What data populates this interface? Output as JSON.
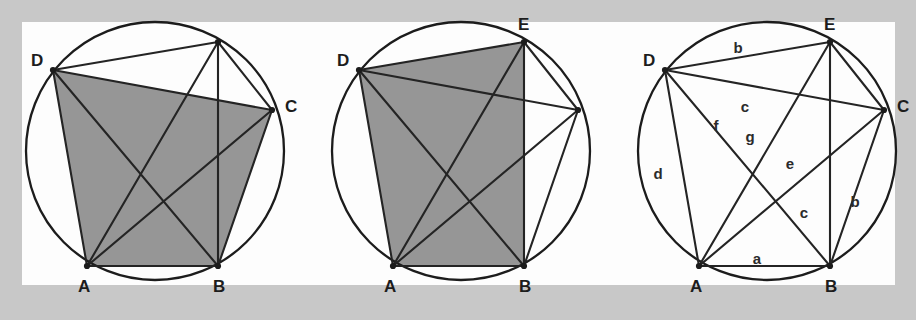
{
  "figure": {
    "kind": "geometry-diagram",
    "background_color": "#c8c8c8",
    "panel_color": "#fdfdfd",
    "shade_color": "#969696",
    "line_color": "#242424",
    "label_color": "#1d1d1d"
  },
  "panels": [
    {
      "id": "panel-1",
      "name": "cyclic-polygon-shaded-abcd",
      "circle": {
        "cx": 155,
        "cy": 151,
        "r": 129
      },
      "vertices": [
        {
          "id": "A",
          "label": "A",
          "x": 87,
          "y": 266,
          "label_x": 78,
          "label_y": 292,
          "labeled": true
        },
        {
          "id": "B",
          "label": "B",
          "x": 218,
          "y": 266,
          "label_x": 213,
          "label_y": 292,
          "labeled": true
        },
        {
          "id": "C",
          "label": "C",
          "x": 272,
          "y": 110,
          "label_x": 285,
          "label_y": 112,
          "labeled": true
        },
        {
          "id": "E",
          "label": "",
          "x": 218,
          "y": 42,
          "label_x": 0,
          "label_y": 0,
          "labeled": false
        },
        {
          "id": "D",
          "label": "D",
          "x": 53,
          "y": 70,
          "label_x": 31,
          "label_y": 66,
          "labeled": true
        }
      ],
      "shaded_polygon": [
        "A",
        "B",
        "C",
        "D"
      ],
      "chords": [
        [
          "D",
          "E"
        ],
        [
          "D",
          "C"
        ],
        [
          "D",
          "A"
        ],
        [
          "D",
          "B"
        ],
        [
          "E",
          "B"
        ],
        [
          "E",
          "A"
        ],
        [
          "E",
          "C"
        ],
        [
          "A",
          "B"
        ],
        [
          "A",
          "C"
        ],
        [
          "B",
          "C"
        ]
      ]
    },
    {
      "id": "panel-2",
      "name": "cyclic-polygon-shaded-abed",
      "circle": {
        "cx": 461,
        "cy": 151,
        "r": 129
      },
      "vertices": [
        {
          "id": "A",
          "label": "A",
          "x": 393,
          "y": 266,
          "label_x": 384,
          "label_y": 292,
          "labeled": true
        },
        {
          "id": "B",
          "label": "B",
          "x": 524,
          "y": 266,
          "label_x": 519,
          "label_y": 292,
          "labeled": true
        },
        {
          "id": "C",
          "label": "",
          "x": 578,
          "y": 110,
          "label_x": 0,
          "label_y": 0,
          "labeled": false
        },
        {
          "id": "E",
          "label": "E",
          "x": 524,
          "y": 42,
          "label_x": 518,
          "label_y": 30,
          "labeled": true
        },
        {
          "id": "D",
          "label": "D",
          "x": 359,
          "y": 70,
          "label_x": 337,
          "label_y": 66,
          "labeled": true
        }
      ],
      "shaded_polygon": [
        "A",
        "B",
        "E",
        "D"
      ],
      "chords": [
        [
          "D",
          "E"
        ],
        [
          "D",
          "C"
        ],
        [
          "D",
          "A"
        ],
        [
          "D",
          "B"
        ],
        [
          "E",
          "B"
        ],
        [
          "E",
          "A"
        ],
        [
          "E",
          "C"
        ],
        [
          "A",
          "B"
        ],
        [
          "A",
          "C"
        ],
        [
          "B",
          "C"
        ]
      ]
    },
    {
      "id": "panel-3",
      "name": "cyclic-polygon-labeled-segments",
      "circle": {
        "cx": 767,
        "cy": 151,
        "r": 129
      },
      "vertices": [
        {
          "id": "A",
          "label": "A",
          "x": 699,
          "y": 266,
          "label_x": 690,
          "label_y": 292,
          "labeled": true
        },
        {
          "id": "B",
          "label": "B",
          "x": 830,
          "y": 266,
          "label_x": 825,
          "label_y": 292,
          "labeled": true
        },
        {
          "id": "C",
          "label": "C",
          "x": 884,
          "y": 110,
          "label_x": 897,
          "label_y": 112,
          "labeled": true
        },
        {
          "id": "E",
          "label": "E",
          "x": 830,
          "y": 42,
          "label_x": 824,
          "label_y": 30,
          "labeled": true
        },
        {
          "id": "D",
          "label": "D",
          "x": 665,
          "y": 70,
          "label_x": 643,
          "label_y": 66,
          "labeled": true
        }
      ],
      "shaded_polygon": [],
      "chords": [
        [
          "D",
          "E"
        ],
        [
          "D",
          "C"
        ],
        [
          "D",
          "A"
        ],
        [
          "D",
          "B"
        ],
        [
          "E",
          "B"
        ],
        [
          "E",
          "A"
        ],
        [
          "E",
          "C"
        ],
        [
          "A",
          "B"
        ],
        [
          "A",
          "C"
        ],
        [
          "B",
          "C"
        ]
      ],
      "segment_labels": [
        {
          "id": "seg-de",
          "text": "b",
          "x": 738,
          "y": 53,
          "segment": "DE"
        },
        {
          "id": "seg-dc",
          "text": "c",
          "x": 745,
          "y": 112,
          "segment": "DC"
        },
        {
          "id": "seg-db",
          "text": "f",
          "x": 716,
          "y": 131,
          "segment": "DB"
        },
        {
          "id": "seg-ea",
          "text": "g",
          "x": 750,
          "y": 142,
          "segment": "EA"
        },
        {
          "id": "seg-da",
          "text": "d",
          "x": 658,
          "y": 179,
          "segment": "DA"
        },
        {
          "id": "seg-ac",
          "text": "e",
          "x": 790,
          "y": 169,
          "segment": "AC"
        },
        {
          "id": "seg-eb",
          "text": "c",
          "x": 804,
          "y": 218,
          "segment": "EB"
        },
        {
          "id": "seg-bc",
          "text": "b",
          "x": 855,
          "y": 207,
          "segment": "BC"
        },
        {
          "id": "seg-ab",
          "text": "a",
          "x": 757,
          "y": 264,
          "segment": "AB"
        }
      ]
    }
  ],
  "panel_frames": [
    {
      "id": "frame-left",
      "x": 22,
      "y": 22,
      "width": 283,
      "height": 263
    },
    {
      "id": "frame-mid",
      "x": 305,
      "y": 22,
      "width": 306,
      "height": 263
    },
    {
      "id": "frame-right",
      "x": 611,
      "y": 22,
      "width": 284,
      "height": 263
    }
  ]
}
